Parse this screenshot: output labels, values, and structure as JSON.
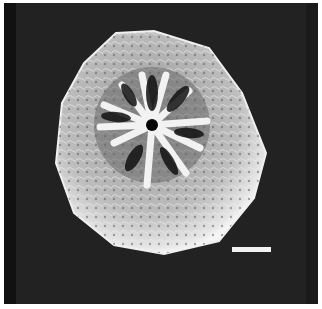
{
  "image": {
    "type": "SEM micrograph",
    "subject": "spherical specimen with radial (star-shaped) aperture of ~12 ridges",
    "background_color": "#222222",
    "specimen_color": "#d8d8d8",
    "scale_bar": {
      "label": "",
      "length_px": 39
    }
  }
}
